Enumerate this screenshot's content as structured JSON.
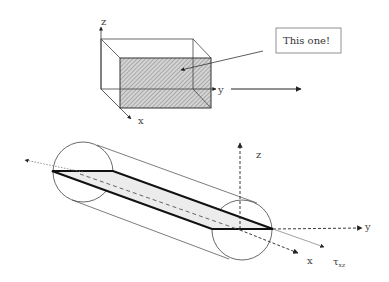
{
  "diagram": {
    "top_box": {
      "axis_labels": {
        "z": "z",
        "y": "y",
        "x": "x"
      },
      "highlighted_face": "front face (hatched)",
      "callout": {
        "text": "This one!"
      }
    },
    "cylinder": {
      "axis_labels": {
        "z": "z",
        "y": "y",
        "x": "x"
      },
      "stress_label": {
        "symbol": "τ",
        "subscript": "xz"
      },
      "highlighted_plane": "shaded diagonal plane"
    },
    "colors": {
      "line": "#333333",
      "hatch_fill": "#bdbdbd",
      "plane_fill": "#ececec",
      "thin_line": "#555555"
    }
  }
}
